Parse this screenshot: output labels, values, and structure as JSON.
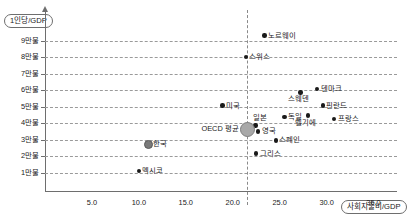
{
  "chart_data": {
    "type": "scatter",
    "title": "",
    "xlabel": "사회지출비/GDP",
    "ylabel": "1인당/GDP",
    "xlim": [
      0.0,
      37.5
    ],
    "ylim": [
      0,
      100000
    ],
    "grid": true,
    "legend": "none",
    "xticks": [
      "5.0",
      "10.0",
      "15.0",
      "20.0",
      "25.0",
      "30.0",
      "35.0"
    ],
    "xtick_values": [
      5.0,
      10.0,
      15.0,
      20.0,
      25.0,
      30.0,
      35.0
    ],
    "yticks": [
      "1만불",
      "2만불",
      "3만불",
      "4만불",
      "5만불",
      "6만불",
      "7만불",
      "8만불",
      "9만불"
    ],
    "ytick_values": [
      10000,
      20000,
      30000,
      40000,
      50000,
      60000,
      70000,
      80000,
      90000
    ],
    "reference_line": {
      "orientation": "vertical",
      "x": 21.5,
      "style": "dashed",
      "label": "OECD 평균"
    },
    "points": [
      {
        "label": "노르웨이",
        "x": 23.4,
        "y": 93000,
        "marker": "small",
        "label_pos": "right"
      },
      {
        "label": "스위스",
        "x": 21.4,
        "y": 80000,
        "marker": "small",
        "label_pos": "right"
      },
      {
        "label": "덴마크",
        "x": 29.0,
        "y": 60500,
        "marker": "small",
        "label_pos": "right"
      },
      {
        "label": "스웨덴",
        "x": 27.2,
        "y": 58500,
        "marker": "small",
        "label_pos": "below"
      },
      {
        "label": "핀란드",
        "x": 29.6,
        "y": 50500,
        "marker": "small",
        "label_pos": "right"
      },
      {
        "label": "미국",
        "x": 18.9,
        "y": 50500,
        "marker": "small",
        "label_pos": "right"
      },
      {
        "label": "독일",
        "x": 25.5,
        "y": 43500,
        "marker": "small",
        "label_pos": "right"
      },
      {
        "label": "벨기에",
        "x": 28.0,
        "y": 44500,
        "marker": "small",
        "label_pos": "below"
      },
      {
        "label": "프랑스",
        "x": 30.8,
        "y": 42500,
        "marker": "small",
        "label_pos": "right"
      },
      {
        "label": "일본",
        "x": 22.4,
        "y": 38500,
        "marker": "small",
        "label_pos": "above"
      },
      {
        "label": "영국",
        "x": 22.7,
        "y": 35000,
        "marker": "small",
        "label_pos": "right"
      },
      {
        "label": "OECD 평균",
        "x": 21.5,
        "y": 36500,
        "marker": "big",
        "label_pos": "left"
      },
      {
        "label": "스페인",
        "x": 24.6,
        "y": 29500,
        "marker": "small",
        "label_pos": "right"
      },
      {
        "label": "그리스",
        "x": 22.5,
        "y": 21500,
        "marker": "small",
        "label_pos": "right"
      },
      {
        "label": "한국",
        "x": 10.9,
        "y": 27500,
        "marker": "mid",
        "label_pos": "right"
      },
      {
        "label": "멕시코",
        "x": 10.0,
        "y": 11000,
        "marker": "small",
        "label_pos": "right"
      }
    ]
  }
}
